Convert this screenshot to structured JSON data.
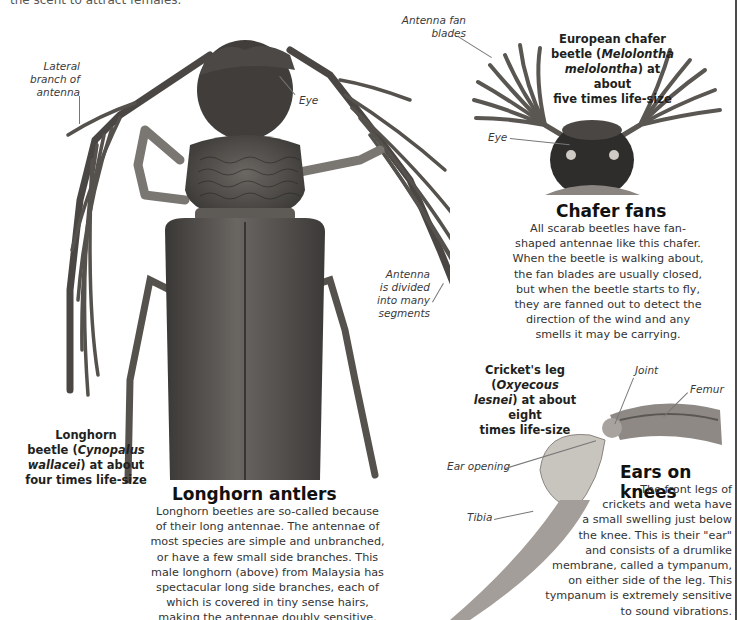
{
  "page": {
    "top_cut_text": "the scent to attract females.",
    "rule_color": "#4a4a4a"
  },
  "longhorn": {
    "labels": {
      "lateral_branch": [
        "Lateral",
        "branch of",
        "antenna"
      ],
      "eye": "Eye",
      "antenna_segments": [
        "Antenna",
        "is divided",
        "into many",
        "segments"
      ]
    },
    "caption": {
      "line1": "Longhorn",
      "line2_pre": "beetle (",
      "line2_italic": "Cynopalus",
      "line3_italic": "wallacei",
      "line3_post": ") at about",
      "line4": "four times life-size"
    },
    "heading": "Longhorn antlers",
    "body_lines": [
      "Longhorn beetles are so-called because",
      "of their long antennae. The antennae of",
      "most species are simple and unbranched,",
      "or have a few small side branches. This",
      "male longhorn (above) from Malaysia has",
      "spectacular long side branches, each of",
      "which is covered in tiny sense hairs,",
      "making the antennae doubly sensitive."
    ]
  },
  "chafer": {
    "labels": {
      "fan_blades": [
        "Antenna fan",
        "blades"
      ],
      "eye": "Eye"
    },
    "caption": {
      "line1": "European chafer",
      "line2_pre": "beetle (",
      "line2_italic": "Melolontha",
      "line3_italic": "melolontha",
      "line3_post": ") at about",
      "line4": "five times life-size"
    },
    "heading": "Chafer fans",
    "body_lines": [
      "All scarab beetles have fan-",
      "shaped antennae like this chafer.",
      "When the beetle is walking about,",
      "the fan blades are usually closed,",
      "but when the beetle starts to fly,",
      "they are fanned out to detect the",
      "direction of the wind and any",
      "smells it may be carrying."
    ]
  },
  "cricket": {
    "labels": {
      "joint": "Joint",
      "femur": "Femur",
      "ear_opening": "Ear opening",
      "tibia": "Tibia"
    },
    "caption": {
      "line1_pre": "Cricket's leg (",
      "line1_italic": "Oxyecous",
      "line2_italic": "lesnei",
      "line2_post": ") at about eight",
      "line3": "times life-size"
    },
    "heading": "Ears on knees",
    "body_lines": [
      "The front legs of",
      "crickets and weta have",
      "a small swelling just below",
      "the knee. This is their \"ear\"",
      "and consists of a drumlike",
      "membrane, called a tympanum,",
      "on either side of the leg. This",
      "tympanum is extremely sensitive",
      "to sound vibrations."
    ]
  }
}
